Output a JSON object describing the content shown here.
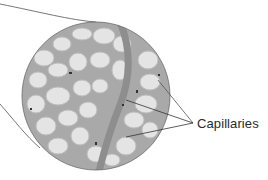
{
  "figure": {
    "label": "Capillaries",
    "colors": {
      "background": "#ffffff",
      "tissue_light": "#e6e6e6",
      "tissue_mid": "#b8b8b8",
      "vessel": "#8e8e8e",
      "outline": "#5a5a5a",
      "leader_line": "#555555",
      "text": "#2a2a2a"
    },
    "magnifier": {
      "cx": 96,
      "cy": 96,
      "r": 74
    },
    "leader_lines": [
      {
        "x1": 193,
        "y1": 123,
        "x2": 158,
        "y2": 80
      },
      {
        "x1": 193,
        "y1": 123,
        "x2": 126,
        "y2": 100
      },
      {
        "x1": 193,
        "y1": 123,
        "x2": 126,
        "y2": 137
      }
    ]
  }
}
